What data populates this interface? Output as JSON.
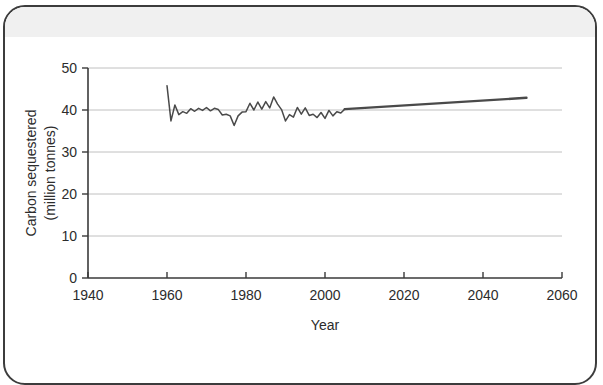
{
  "figure": {
    "background_color": "#ffffff",
    "border_color": "#3c3c3c",
    "band_color": "#f0f0f0"
  },
  "chart_data": {
    "type": "line",
    "title": "",
    "subtitle": "",
    "xlabel": "Year",
    "ylabel": "Carbon sequestered (million tonnes)",
    "ylabel_line1": "Carbon sequestered",
    "ylabel_line2": "(million tonnes)",
    "xlim": [
      1940,
      2060
    ],
    "ylim": [
      0,
      50
    ],
    "xticks": [
      1940,
      1960,
      1980,
      2000,
      2020,
      2040,
      2060
    ],
    "xtick_labels": [
      "1940",
      "1960",
      "1980",
      "2000",
      "2020",
      "2040",
      "2060"
    ],
    "yticks": [
      0,
      10,
      20,
      30,
      40,
      50
    ],
    "ytick_labels": [
      "0",
      "10",
      "20",
      "30",
      "40",
      "50"
    ],
    "grid": "horizontal",
    "grid_color": "#b9b9b9",
    "legend": "none",
    "line_color": "#4a4a4a",
    "series": [
      {
        "name": "Historical carbon sequestered",
        "style": "thin",
        "x": [
          1960,
          1961,
          1962,
          1963,
          1964,
          1965,
          1966,
          1967,
          1968,
          1969,
          1970,
          1971,
          1972,
          1973,
          1974,
          1975,
          1976,
          1977,
          1978,
          1979,
          1980,
          1981,
          1982,
          1983,
          1984,
          1985,
          1986,
          1987,
          1988,
          1989,
          1990,
          1991,
          1992,
          1993,
          1994,
          1995,
          1996,
          1997,
          1998,
          1999,
          2000,
          2001,
          2002,
          2003,
          2004,
          2005
        ],
        "values": [
          45.8,
          37.4,
          41.2,
          38.9,
          39.6,
          39.2,
          40.3,
          39.7,
          40.4,
          39.9,
          40.6,
          39.8,
          40.4,
          40.1,
          38.8,
          39.0,
          38.6,
          36.3,
          38.6,
          39.5,
          39.6,
          41.6,
          40.0,
          41.9,
          40.2,
          42.0,
          40.5,
          43.1,
          41.4,
          40.1,
          37.4,
          38.9,
          38.3,
          40.6,
          39.0,
          40.5,
          38.7,
          39.0,
          38.2,
          39.4,
          38.0,
          39.9,
          38.6,
          39.6,
          39.3,
          40.2
        ]
      },
      {
        "name": "Projected carbon sequestered",
        "style": "thick",
        "x": [
          2005,
          2051
        ],
        "values": [
          40.2,
          42.9
        ]
      }
    ]
  },
  "annotations": []
}
